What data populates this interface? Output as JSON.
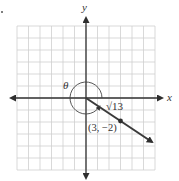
{
  "diagram": {
    "type": "coordinate-plane",
    "grid": {
      "x_min": -6,
      "x_max": 6,
      "y_min": -6,
      "y_max": 6,
      "line_color": "#cfcfcf",
      "axis_color": "#333333"
    },
    "axes": {
      "x_label": "x",
      "y_label": "y"
    },
    "ray": {
      "from": [
        0,
        0
      ],
      "through": [
        3,
        -2
      ],
      "color": "#3a3a3a"
    },
    "point": {
      "x": 3,
      "y": -2,
      "label": "(3, −2)"
    },
    "segment_length_label": "√13",
    "angle": {
      "label": "θ",
      "direction": "counterclockwise",
      "from": "positive x-axis",
      "to": "terminal ray"
    }
  }
}
